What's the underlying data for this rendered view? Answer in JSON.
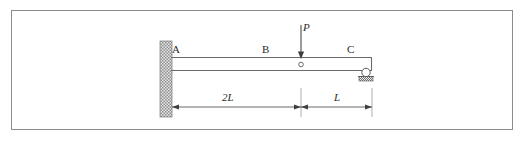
{
  "figure": {
    "kind": "beam-free-body-diagram",
    "frame": {
      "border_color": "#8c8c8c",
      "background_color": "#ffffff"
    },
    "line_color": "#555555",
    "wall_color": "#9a9a9a"
  },
  "labels": {
    "point_a": "A",
    "point_b": "B",
    "point_c": "C",
    "load_p": "P",
    "dimension_left": "2L",
    "dimension_right": "L"
  },
  "icons": {
    "fixed_support": "fixed-wall-support-icon",
    "roller_support": "roller-support-icon",
    "internal_hinge": "internal-hinge-icon",
    "load_arrow": "downward-load-arrow-icon",
    "dimension_arrow_left": "dimension-arrow-left-icon",
    "dimension_arrow_right": "dimension-arrow-right-icon"
  },
  "geometry": {
    "beam_left_x": 172,
    "beam_right_x": 372,
    "beam_top_y": 57,
    "beam_bottom_y": 70,
    "wall_x": 160,
    "wall_width": 12,
    "wall_top_y": 41,
    "wall_height": 76,
    "hinge_x": 301,
    "hinge_y": 66,
    "load_x": 301,
    "load_top_y": 25,
    "load_bottom_y": 62,
    "roller_x": 366,
    "roller_y": 73,
    "dimension_y": 107,
    "dimension_start_x": 172,
    "dimension_mid_x": 301,
    "dimension_end_x": 372
  }
}
